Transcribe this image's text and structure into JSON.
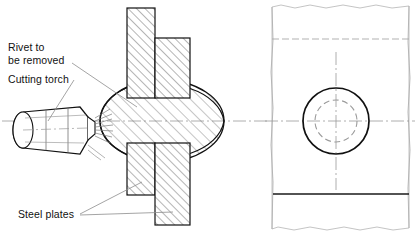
{
  "figure": {
    "background_color": "#ffffff",
    "line_color": "#1a1a1a",
    "hatch_color": "#555555",
    "centerline_color": "#8a8a8a"
  },
  "labels": {
    "rivet": {
      "line1": "Rivet to",
      "line2": "be removed"
    },
    "torch": "Cutting torch",
    "plates": "Steel plates"
  },
  "side_view": {
    "name": "sectional-side-view",
    "rivet": {
      "shape": "ellipse",
      "center_x": 162,
      "center_y": 121,
      "radius_x": 62,
      "radius_y": 41,
      "hatch_angle_deg": 45
    },
    "plates": [
      {
        "name": "upper-left-plate",
        "x": 127,
        "y": 8,
        "width": 28,
        "height": 90
      },
      {
        "name": "upper-right-plate",
        "x": 155,
        "y": 38,
        "width": 35,
        "height": 60
      },
      {
        "name": "lower-left-plate",
        "x": 127,
        "y": 143,
        "width": 28,
        "height": 52
      },
      {
        "name": "lower-right-plate",
        "x": 155,
        "y": 143,
        "width": 35,
        "height": 82
      }
    ],
    "torch": {
      "name": "cutting-torch-nozzle",
      "tip_x": 88,
      "body_left_x": 12,
      "center_y": 128,
      "flame_lines": 7
    },
    "centerline_y": 121
  },
  "front_view": {
    "name": "front-view",
    "plate_left_x": 272,
    "plate_right_x": 409,
    "plate_top_y": 6,
    "plate_bottom_y": 228,
    "break_line_top_y": 39,
    "solid_edge_line_y": 194,
    "rivet_head_circle": {
      "name": "rivet-head-circle",
      "center_x": 336,
      "center_y": 121,
      "radius": 33,
      "style": "solid"
    },
    "rivet_shank_circle": {
      "name": "rivet-shank-circle",
      "center_x": 336,
      "center_y": 121,
      "radius": 21,
      "style": "dashed"
    },
    "centerline_horizontal_y": 121,
    "centerline_vertical_x": 336
  }
}
